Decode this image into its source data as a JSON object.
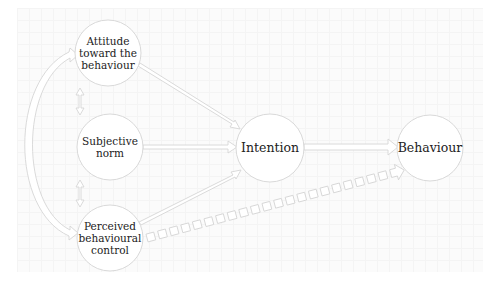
{
  "diagram": {
    "colors": {
      "background": "#fbfbfb",
      "grid": "#f4f4f4",
      "stroke": "#d6d6d6",
      "node_fill": "#ffffff",
      "text": "#222222"
    },
    "nodes": [
      {
        "id": "attitude",
        "label": "Attitude\ntoward the\nbehaviour",
        "cx": 108,
        "cy": 53,
        "r": 33
      },
      {
        "id": "norm",
        "label": "Subjective\nnorm",
        "cx": 110,
        "cy": 147,
        "r": 33
      },
      {
        "id": "pbc",
        "label": "Perceived\nbehavioural\ncontrol",
        "cx": 110,
        "cy": 238,
        "r": 33
      },
      {
        "id": "intention",
        "label": "Intention",
        "cx": 270,
        "cy": 148,
        "r": 34
      },
      {
        "id": "behaviour",
        "label": "Behaviour",
        "cx": 430,
        "cy": 148,
        "r": 33
      }
    ],
    "edges": [
      {
        "from": "attitude",
        "to": "intention",
        "style": "solid"
      },
      {
        "from": "norm",
        "to": "intention",
        "style": "solid"
      },
      {
        "from": "pbc",
        "to": "intention",
        "style": "solid"
      },
      {
        "from": "intention",
        "to": "behaviour",
        "style": "solid"
      },
      {
        "from": "pbc",
        "to": "behaviour",
        "style": "dashed"
      },
      {
        "from": "attitude",
        "to": "norm",
        "style": "bidirectional"
      },
      {
        "from": "norm",
        "to": "pbc",
        "style": "bidirectional"
      },
      {
        "from": "attitude",
        "to": "pbc",
        "style": "bidirectional-arc"
      }
    ]
  }
}
